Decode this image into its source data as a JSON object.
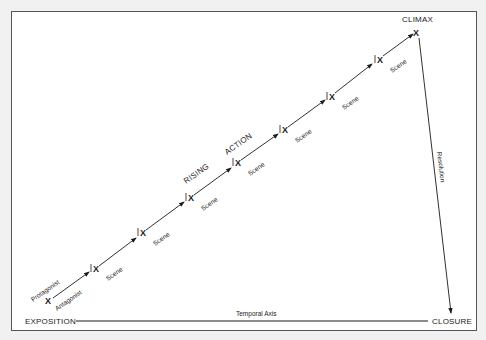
{
  "diagram": {
    "labels": {
      "exposition": "EXPOSITION",
      "closure": "CLOSURE",
      "climax": "CLIMAX",
      "temporal_axis": "Temporal Axis",
      "rising": "RISING",
      "action": "ACTION",
      "resolution": "Resolution",
      "protagonist": "Protagonist",
      "antagonist": "Antagonist",
      "x_marker": "X"
    },
    "scenes": [
      {
        "label": "Scene"
      },
      {
        "label": "Scene"
      },
      {
        "label": "Scene"
      },
      {
        "label": "Scene"
      },
      {
        "label": "Scene"
      },
      {
        "label": "Scene"
      },
      {
        "label": "Scene"
      },
      {
        "label": "Scene"
      }
    ],
    "colors": {
      "background": "#f1f1f1",
      "frame_fill": "#ffffff",
      "frame_border": "#555555",
      "ink": "#1a1a1a"
    }
  }
}
